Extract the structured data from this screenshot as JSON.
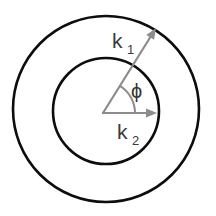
{
  "figure": {
    "background_color": "#ffffff",
    "width": 216,
    "height": 216
  },
  "circles": {
    "outer": {
      "name": "outer-circle",
      "center_x": 106,
      "center_y": 109,
      "radius": 93,
      "stroke_color": "#0d0d0d",
      "stroke_width": 2.6,
      "fill": "none"
    },
    "inner": {
      "name": "inner-circle",
      "center_x": 106,
      "center_y": 111,
      "radius": 53,
      "stroke_color": "#0d0d0d",
      "stroke_width": 2.6,
      "fill": "none"
    }
  },
  "origin": {
    "x": 103,
    "y": 113
  },
  "vectors": [
    {
      "id": "k1",
      "label": "k",
      "subscript": "1",
      "from_x": 103,
      "from_y": 113,
      "to_x": 156,
      "to_y": 28,
      "angle_degrees": 58,
      "length": 100,
      "stroke_color": "#8c8c8c",
      "stroke_width": 2.2,
      "label_x": 112,
      "label_y": 48,
      "subscript_x": 127,
      "subscript_y": 54
    },
    {
      "id": "k2",
      "label": "k",
      "subscript": "2",
      "from_x": 103,
      "from_y": 113,
      "to_x": 157,
      "to_y": 113,
      "angle_degrees": 0,
      "length": 54,
      "stroke_color": "#8c8c8c",
      "stroke_width": 2.2,
      "label_x": 117,
      "label_y": 139,
      "subscript_x": 132,
      "subscript_y": 145
    }
  ],
  "angle_arc": {
    "id": "phi-arc",
    "label": "ϕ",
    "radius": 32,
    "start_degrees": 0,
    "end_degrees": 58,
    "stroke_color": "#8c8c8c",
    "stroke_width": 2.0,
    "label_x": 131,
    "label_y": 98
  },
  "colors": {
    "circle_stroke": "#0d0d0d",
    "vector_stroke": "#8c8c8c",
    "label_fill": "#3a3a3a",
    "background": "#ffffff"
  }
}
